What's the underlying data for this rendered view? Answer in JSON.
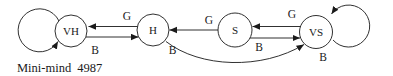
{
  "figure": {
    "caption": "Mini-mind 4987",
    "nodes": [
      {
        "id": "VH",
        "label": "VH"
      },
      {
        "id": "H",
        "label": "H"
      },
      {
        "id": "S",
        "label": "S"
      },
      {
        "id": "VS",
        "label": "VS"
      }
    ],
    "edges": [
      {
        "from": "H",
        "to": "VH",
        "label": "G"
      },
      {
        "from": "VH",
        "to": "H",
        "label": "B"
      },
      {
        "from": "S",
        "to": "H",
        "label": "G"
      },
      {
        "from": "H",
        "to": "VS",
        "label": "B"
      },
      {
        "from": "VS",
        "to": "S",
        "label": "G"
      },
      {
        "from": "S",
        "to": "VS",
        "label": "B"
      },
      {
        "from": "VH",
        "to": "VH",
        "label": ""
      },
      {
        "from": "VS",
        "to": "VS",
        "label": "B"
      }
    ],
    "colors": {
      "ink": "#1a1a1a",
      "background": "#ffffff"
    }
  }
}
